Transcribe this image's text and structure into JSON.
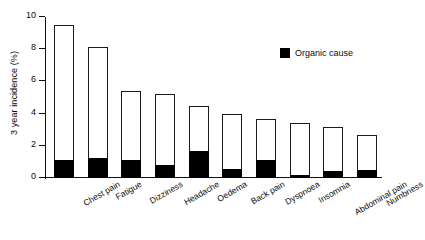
{
  "chart_data": {
    "type": "bar",
    "title": "",
    "subtitle": "",
    "xlabel": "",
    "ylabel": "3 year incidence (%)",
    "ylim": [
      0,
      10
    ],
    "yticks": [
      0,
      2,
      4,
      6,
      8,
      10
    ],
    "ytick_labels": [
      "0",
      "2",
      "4",
      "6",
      "8",
      "10"
    ],
    "grid": false,
    "stacked": true,
    "legend_position": "upper-right",
    "legend": [
      {
        "name": "Organic cause",
        "color": "#000000"
      },
      {
        "name": "Total incidence",
        "color": "#ffffff"
      }
    ],
    "categories": [
      "Chest pain",
      "Fatigue",
      "Dizziness",
      "Headache",
      "Oedema",
      "Back pain",
      "Dyspnoea",
      "Insomnia",
      "Abdominal pain",
      "Numbness"
    ],
    "series": [
      {
        "name": "Total incidence",
        "color": "#ffffff",
        "values": [
          9.5,
          8.15,
          5.4,
          5.2,
          4.5,
          4.0,
          3.65,
          3.4,
          3.15,
          2.7
        ]
      },
      {
        "name": "Organic cause",
        "color": "#000000",
        "values": [
          1.15,
          1.25,
          1.1,
          0.8,
          1.65,
          0.55,
          1.1,
          0.2,
          0.45,
          0.5
        ]
      }
    ]
  },
  "legend": {
    "organic_label": "Organic cause",
    "swatch_color": "#000000"
  },
  "axes": {
    "y_title": "3 year incidence (%)",
    "y_min": 0,
    "y_max": 10
  }
}
